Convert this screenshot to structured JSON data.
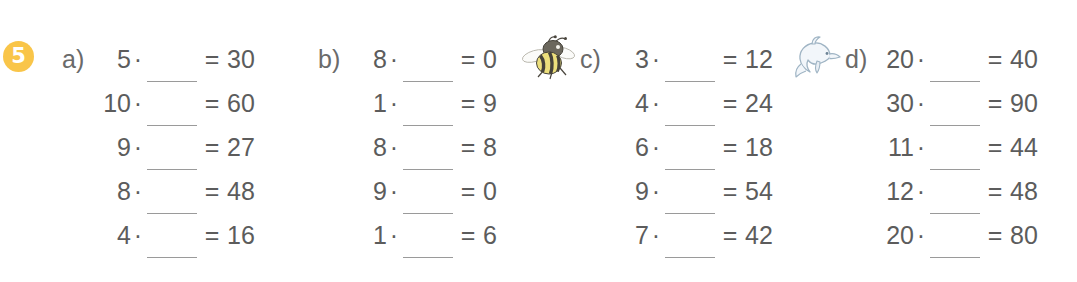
{
  "exercise": {
    "number": "5",
    "badge_color": "#f9c549",
    "badge_text_color": "#ffffff"
  },
  "style": {
    "text_color": "#5c5c5c",
    "rule_color": "#9a9a9a",
    "background": "#ffffff"
  },
  "operator": "·",
  "equals": "=",
  "blank_placeholder": "",
  "columns": [
    {
      "label": "a)",
      "rows": [
        {
          "factor": "5",
          "operator": "·",
          "blank": "",
          "equals": "=",
          "result": "30"
        },
        {
          "factor": "10",
          "operator": "·",
          "blank": "",
          "equals": "=",
          "result": "60"
        },
        {
          "factor": "9",
          "operator": "·",
          "blank": "",
          "equals": "=",
          "result": "27"
        },
        {
          "factor": "8",
          "operator": "·",
          "blank": "",
          "equals": "=",
          "result": "48"
        },
        {
          "factor": "4",
          "operator": "·",
          "blank": "",
          "equals": "=",
          "result": "16"
        }
      ]
    },
    {
      "label": "b)",
      "rows": [
        {
          "factor": "8",
          "operator": "·",
          "blank": "",
          "equals": "=",
          "result": "0"
        },
        {
          "factor": "1",
          "operator": "·",
          "blank": "",
          "equals": "=",
          "result": "9"
        },
        {
          "factor": "8",
          "operator": "·",
          "blank": "",
          "equals": "=",
          "result": "8"
        },
        {
          "factor": "9",
          "operator": "·",
          "blank": "",
          "equals": "=",
          "result": "0"
        },
        {
          "factor": "1",
          "operator": "·",
          "blank": "",
          "equals": "=",
          "result": "6"
        }
      ]
    },
    {
      "label": "c)",
      "rows": [
        {
          "factor": "3",
          "operator": "·",
          "blank": "",
          "equals": "=",
          "result": "12"
        },
        {
          "factor": "4",
          "operator": "·",
          "blank": "",
          "equals": "=",
          "result": "24"
        },
        {
          "factor": "6",
          "operator": "·",
          "blank": "",
          "equals": "=",
          "result": "18"
        },
        {
          "factor": "9",
          "operator": "·",
          "blank": "",
          "equals": "=",
          "result": "54"
        },
        {
          "factor": "7",
          "operator": "·",
          "blank": "",
          "equals": "=",
          "result": "42"
        }
      ]
    },
    {
      "label": "d)",
      "rows": [
        {
          "factor": "20",
          "operator": "·",
          "blank": "",
          "equals": "=",
          "result": "40"
        },
        {
          "factor": "30",
          "operator": "·",
          "blank": "",
          "equals": "=",
          "result": "90"
        },
        {
          "factor": "11",
          "operator": "·",
          "blank": "",
          "equals": "=",
          "result": "44"
        },
        {
          "factor": "12",
          "operator": "·",
          "blank": "",
          "equals": "=",
          "result": "48"
        },
        {
          "factor": "20",
          "operator": "·",
          "blank": "",
          "equals": "=",
          "result": "80"
        }
      ]
    }
  ],
  "clipart": [
    {
      "name": "bee-illustration",
      "icon": "bee-icon",
      "colors": {
        "body": "#e8d96a",
        "stripe": "#3d3a33",
        "wing": "#f4f4f2"
      }
    },
    {
      "name": "dolphin-illustration",
      "icon": "dolphin-icon",
      "colors": {
        "body": "#eef3f7",
        "outline": "#9fb4c4"
      }
    }
  ]
}
